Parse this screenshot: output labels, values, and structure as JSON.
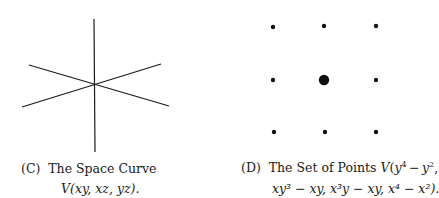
{
  "figures": [
    {
      "id": "C",
      "caption_label": "(C)",
      "caption_line1": "The Space Curve",
      "caption_line2": "V(xy, xz, yz).",
      "lines": [
        {
          "x1": 94,
          "y1": 19,
          "x2": 95,
          "y2": 152
        },
        {
          "x1": 22,
          "y1": 107,
          "x2": 161,
          "y2": 64
        },
        {
          "x1": 29,
          "y1": 65,
          "x2": 169,
          "y2": 106
        }
      ]
    },
    {
      "id": "D",
      "caption_label": "(D)",
      "caption_line1_prefix": "The Set of Points V(y",
      "caption_line2": "xy³ − xy, x³y − xy, x⁴ − x²).",
      "points": [
        {
          "x": 273,
          "y": 27,
          "r": 2.2
        },
        {
          "x": 324,
          "y": 26,
          "r": 2.2
        },
        {
          "x": 376,
          "y": 26,
          "r": 2.2
        },
        {
          "x": 273,
          "y": 80,
          "r": 2.2
        },
        {
          "x": 324,
          "y": 80,
          "r": 5.2
        },
        {
          "x": 376,
          "y": 80,
          "r": 2.2
        },
        {
          "x": 274,
          "y": 132,
          "r": 2.2
        },
        {
          "x": 325,
          "y": 132,
          "r": 2.2
        },
        {
          "x": 376,
          "y": 132,
          "r": 2.2
        }
      ]
    }
  ]
}
